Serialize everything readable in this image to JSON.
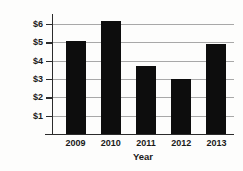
{
  "chart_data": {
    "type": "bar",
    "title": "",
    "xlabel": "Year",
    "ylabel": "Sales Revenue in Millions",
    "categories": [
      "2009",
      "2010",
      "2011",
      "2012",
      "2013"
    ],
    "values": [
      5.1,
      6.15,
      3.7,
      3.0,
      4.9
    ],
    "ylim": [
      0,
      6.5
    ],
    "yticks": [
      1,
      2,
      3,
      4,
      5,
      6
    ],
    "ytick_labels": [
      "$1",
      "$2",
      "$3",
      "$4",
      "$5",
      "$6"
    ],
    "grid": true,
    "legend": null,
    "bar_color": "#0d0d0d",
    "grid_color": "#a8a8a8",
    "axis_color": "#2b2b2b",
    "background_color": "#fdfdfc"
  }
}
